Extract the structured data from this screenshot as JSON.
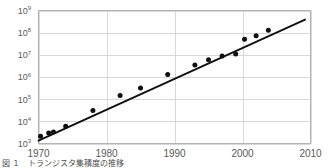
{
  "figure": {
    "caption": "図 １　トランジスタ集積度の推移",
    "background_color": "#ffffff",
    "grid_color": "#d8d8d8",
    "frame_color": "#b4b4b4",
    "marker_color": "#101010",
    "line_color": "#101010",
    "tick_label_color": "#5a5a5a"
  },
  "chart_data": {
    "type": "scatter",
    "title": "",
    "subtitle": "",
    "xlabel": "",
    "ylabel": "",
    "xlim": [
      1970,
      2010
    ],
    "ylim": [
      1000,
      1000000000
    ],
    "yscale": "log",
    "xscale": "linear",
    "grid": true,
    "legend": null,
    "xticks": [
      1970,
      1980,
      1990,
      2000,
      2010
    ],
    "xtick_labels": [
      "1970",
      "1980",
      "1990",
      "2000",
      "2010"
    ],
    "yticks": [
      1000,
      10000,
      100000,
      1000000,
      10000000,
      100000000,
      1000000000
    ],
    "ytick_labels": [
      "10³",
      "10⁴",
      "10⁵",
      "10⁶",
      "10⁷",
      "10⁸",
      "10⁹"
    ],
    "ytick_mantissa": "10",
    "ytick_exponents": [
      "9",
      "8",
      "7",
      "6",
      "5",
      "4",
      "3"
    ],
    "series": [
      {
        "name": "data points",
        "kind": "scatter",
        "marker": "filled-circle",
        "marker_size_px": 5,
        "points": [
          {
            "x": 1970.3,
            "y": 2100
          },
          {
            "x": 1971.5,
            "y": 3000
          },
          {
            "x": 1972.2,
            "y": 3300
          },
          {
            "x": 1974.0,
            "y": 6000
          },
          {
            "x": 1978.0,
            "y": 31000
          },
          {
            "x": 1982.0,
            "y": 145000
          },
          {
            "x": 1985.0,
            "y": 320000
          },
          {
            "x": 1989.0,
            "y": 1300000
          },
          {
            "x": 1993.0,
            "y": 3500000
          },
          {
            "x": 1995.0,
            "y": 6000000
          },
          {
            "x": 1997.0,
            "y": 8800000
          },
          {
            "x": 1999.0,
            "y": 11000000
          },
          {
            "x": 2000.3,
            "y": 50000000
          },
          {
            "x": 2002.0,
            "y": 72000000
          },
          {
            "x": 2003.8,
            "y": 130000000
          }
        ]
      },
      {
        "name": "trend line",
        "kind": "line",
        "endpoints": [
          {
            "x": 1970.0,
            "y": 1350
          },
          {
            "x": 2009.2,
            "y": 390000000
          }
        ]
      }
    ]
  }
}
